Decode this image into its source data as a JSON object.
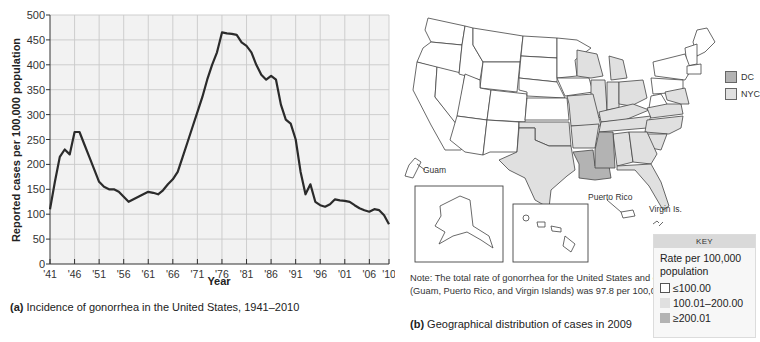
{
  "chart_data": {
    "type": "line",
    "title": "Incidence of gonorrhea in the United States, 1941–2010",
    "caption_prefix": "(a)",
    "xlabel": "Year",
    "ylabel": "Reported cases per 100,000 population",
    "xlim": [
      1941,
      2010
    ],
    "ylim": [
      0,
      500
    ],
    "yticks": [
      0,
      50,
      100,
      150,
      200,
      250,
      300,
      350,
      400,
      450,
      500
    ],
    "xticks": [
      1941,
      1946,
      1951,
      1956,
      1961,
      1966,
      1971,
      1976,
      1981,
      1986,
      1991,
      1996,
      2001,
      2006,
      2010
    ],
    "xtick_labels": [
      "'41",
      "'46",
      "'51",
      "'56",
      "'61",
      "'66",
      "'71",
      "'76",
      "'81",
      "'86",
      "'91",
      "'96",
      "'01",
      "'06",
      "'10"
    ],
    "grid": true,
    "series": [
      {
        "name": "Gonorrhea incidence",
        "x": [
          1941,
          1942,
          1943,
          1944,
          1945,
          1946,
          1947,
          1948,
          1949,
          1950,
          1951,
          1952,
          1953,
          1954,
          1955,
          1956,
          1957,
          1958,
          1959,
          1960,
          1961,
          1962,
          1963,
          1964,
          1965,
          1966,
          1967,
          1968,
          1969,
          1970,
          1971,
          1972,
          1973,
          1974,
          1975,
          1976,
          1977,
          1978,
          1979,
          1980,
          1981,
          1982,
          1983,
          1984,
          1985,
          1986,
          1987,
          1988,
          1989,
          1990,
          1991,
          1992,
          1993,
          1994,
          1995,
          1996,
          1997,
          1998,
          1999,
          2000,
          2001,
          2002,
          2003,
          2004,
          2005,
          2006,
          2007,
          2008,
          2009,
          2010
        ],
        "values": [
          110,
          165,
          215,
          230,
          220,
          265,
          265,
          240,
          215,
          190,
          165,
          155,
          150,
          150,
          145,
          135,
          125,
          130,
          135,
          140,
          145,
          143,
          140,
          148,
          160,
          170,
          185,
          215,
          245,
          275,
          305,
          335,
          370,
          400,
          425,
          465,
          463,
          462,
          460,
          445,
          438,
          425,
          400,
          380,
          370,
          378,
          370,
          320,
          290,
          282,
          250,
          185,
          140,
          160,
          125,
          118,
          115,
          120,
          130,
          128,
          127,
          125,
          118,
          112,
          108,
          105,
          110,
          108,
          98,
          80
        ]
      }
    ],
    "line_color": "#2b2b2b",
    "grid_color": "#c9c9c9",
    "plot_bg": "#f2f2f2"
  },
  "panel_a": {
    "caption_label": "(a)",
    "caption_text": " Incidence of gonorrhea in the United States, 1941–2010",
    "xlabel": "Year",
    "ylabel": "Reported cases per 100,000 population"
  },
  "panel_b": {
    "caption_label": "(b)",
    "caption_text": " Geographical distribution of cases in 2009",
    "note": "Note: The total rate of gonorrhea for the United States and outlying areas (Guam, Puerto Rico, and Virgin Islands) was 97.8 per 100,000 population.",
    "labels": {
      "guam": "Guam",
      "puerto_rico": "Puerto Rico",
      "virgin_islands": "Virgin Is."
    },
    "side_legend": [
      {
        "label": "DC",
        "color": "#b3b3b3"
      },
      {
        "label": "NYC",
        "color": "#e0e0e0"
      }
    ],
    "key": {
      "header": "KEY",
      "title": "Rate per 100,000 population",
      "items": [
        {
          "label": "≤100.00",
          "color": "#ffffff",
          "border": "#555555"
        },
        {
          "label": "100.01–200.00",
          "color": "#e0e0e0",
          "border": "#e0e0e0"
        },
        {
          "label": "≥200.01",
          "color": "#b3b3b3",
          "border": "#b3b3b3"
        }
      ]
    },
    "colors": {
      "low": "#ffffff",
      "mid": "#e0e0e0",
      "high": "#b3b3b3",
      "border": "#444444"
    }
  }
}
